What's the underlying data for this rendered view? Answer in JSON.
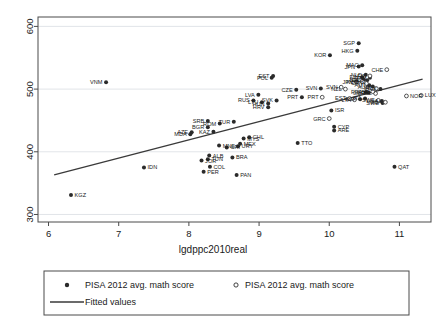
{
  "chart_data": {
    "type": "scatter",
    "title": "",
    "xlabel": "lgdppc2010real",
    "ylabel": "",
    "xlim": [
      5.85,
      11.45
    ],
    "ylim": [
      288,
      615
    ],
    "xticks": [
      "6",
      "7",
      "8",
      "9",
      "10",
      "11"
    ],
    "xtick_values": [
      6,
      7,
      8,
      9,
      10,
      11
    ],
    "yticks": [
      "300",
      "400",
      "500",
      "600"
    ],
    "ytick_values": [
      300,
      400,
      500,
      600
    ],
    "grid": "horizontal",
    "legend_position": "below-plot",
    "legend": {
      "entries": [
        {
          "marker": "filled-circle",
          "label": "PISA 2012 avg. math score"
        },
        {
          "marker": "open-circle",
          "label": "PISA 2012 avg. math score"
        },
        {
          "marker": "line",
          "label": "Fitted values"
        }
      ]
    },
    "fit_line": {
      "label": "Fitted values",
      "x_start": 6.08,
      "y_start": 363,
      "x_end": 11.33,
      "y_end": 516,
      "color": "#3a3a3a"
    },
    "colors": {
      "marker_filled": "#2b2b2b",
      "marker_open": "#2b2b2b",
      "fit_line": "#3a3a3a",
      "grid": "#d9dde2",
      "axis": "#4a4a4a",
      "background": "#ffffff"
    },
    "series": [
      {
        "name": "PISA 2012 avg. math score",
        "marker": "filled-circle",
        "points": [
          {
            "code": "KGZ",
            "x": 6.32,
            "y": 331,
            "lpos": "right"
          },
          {
            "code": "VNM",
            "x": 6.82,
            "y": 511,
            "lpos": "left"
          },
          {
            "code": "IDN",
            "x": 7.36,
            "y": 375,
            "lpos": "right"
          },
          {
            "code": "JOR",
            "x": 8.18,
            "y": 386,
            "lpos": "right"
          },
          {
            "code": "ALB",
            "x": 8.29,
            "y": 394,
            "lpos": "right"
          },
          {
            "code": "TUN",
            "x": 8.27,
            "y": 388,
            "lpos": "right"
          },
          {
            "code": "COL",
            "x": 8.3,
            "y": 376,
            "lpos": "right"
          },
          {
            "code": "PER",
            "x": 8.21,
            "y": 368,
            "lpos": "right"
          },
          {
            "code": "BRA",
            "x": 8.62,
            "y": 391,
            "lpos": "right"
          },
          {
            "code": "PAN",
            "x": 8.68,
            "y": 363,
            "lpos": "right"
          },
          {
            "code": "AZE",
            "x": 8.04,
            "y": 431,
            "lpos": "left"
          },
          {
            "code": "MDA",
            "x": 8.02,
            "y": 428,
            "lpos": "left"
          },
          {
            "code": "SRB",
            "x": 8.27,
            "y": 449,
            "lpos": "left"
          },
          {
            "code": "BGR",
            "x": 8.27,
            "y": 439,
            "lpos": "left"
          },
          {
            "code": "KAZ",
            "x": 8.35,
            "y": 432,
            "lpos": "left"
          },
          {
            "code": "ROM",
            "x": 8.44,
            "y": 445,
            "lpos": "left"
          },
          {
            "code": "TUR",
            "x": 8.64,
            "y": 448,
            "lpos": "left"
          },
          {
            "code": "MNE",
            "x": 8.43,
            "y": 410,
            "lpos": "right"
          },
          {
            "code": "CRI",
            "x": 8.54,
            "y": 407,
            "lpos": "right"
          },
          {
            "code": "URY",
            "x": 8.7,
            "y": 409,
            "lpos": "right"
          },
          {
            "code": "MEX",
            "x": 8.73,
            "y": 413,
            "lpos": "right"
          },
          {
            "code": "MYS",
            "x": 8.78,
            "y": 421,
            "lpos": "right"
          },
          {
            "code": "CHL",
            "x": 8.86,
            "y": 423,
            "lpos": "right"
          },
          {
            "code": "TTO",
            "x": 9.55,
            "y": 414,
            "lpos": "right"
          },
          {
            "code": "QAT",
            "x": 10.93,
            "y": 376,
            "lpos": "right"
          },
          {
            "code": "HRV",
            "x": 9.13,
            "y": 471,
            "lpos": "left"
          },
          {
            "code": "HUN",
            "x": 9.13,
            "y": 477,
            "lpos": "left"
          },
          {
            "code": "LTU",
            "x": 9.04,
            "y": 479,
            "lpos": "left"
          },
          {
            "code": "SVK",
            "x": 9.25,
            "y": 482,
            "lpos": "left"
          },
          {
            "code": "RUS",
            "x": 8.92,
            "y": 482,
            "lpos": "left"
          },
          {
            "code": "LVA",
            "x": 8.99,
            "y": 491,
            "lpos": "left"
          },
          {
            "code": "PRT",
            "x": 9.61,
            "y": 487,
            "lpos": "left"
          },
          {
            "code": "POL",
            "x": 9.18,
            "y": 518,
            "lpos": "left"
          },
          {
            "code": "EST",
            "x": 9.2,
            "y": 521,
            "lpos": "left"
          },
          {
            "code": "CZE",
            "x": 9.53,
            "y": 499,
            "lpos": "left"
          },
          {
            "code": "SVN",
            "x": 9.88,
            "y": 501,
            "lpos": "left"
          },
          {
            "code": "ISR",
            "x": 10.03,
            "y": 466,
            "lpos": "right"
          },
          {
            "code": "CYP",
            "x": 10.07,
            "y": 440,
            "lpos": "right"
          },
          {
            "code": "ARE",
            "x": 10.07,
            "y": 434,
            "lpos": "right"
          },
          {
            "code": "KOR",
            "x": 10.01,
            "y": 554,
            "lpos": "left"
          },
          {
            "code": "SGP",
            "x": 10.42,
            "y": 573,
            "lpos": "left"
          },
          {
            "code": "HKG",
            "x": 10.4,
            "y": 561,
            "lpos": "left"
          },
          {
            "code": "JPN",
            "x": 10.42,
            "y": 536,
            "lpos": "left"
          },
          {
            "code": "MAC",
            "x": 10.47,
            "y": 538,
            "lpos": "left"
          },
          {
            "code": "NLD",
            "x": 10.52,
            "y": 523,
            "lpos": "left"
          },
          {
            "code": "DEU",
            "x": 10.54,
            "y": 514,
            "lpos": "left"
          },
          {
            "code": "BEL",
            "x": 10.49,
            "y": 515,
            "lpos": "left"
          },
          {
            "code": "FIN",
            "x": 10.47,
            "y": 519,
            "lpos": "left"
          },
          {
            "code": "AUT",
            "x": 10.57,
            "y": 506,
            "lpos": "left"
          },
          {
            "code": "FRA",
            "x": 10.52,
            "y": 495,
            "lpos": "left"
          },
          {
            "code": "GBR",
            "x": 10.56,
            "y": 494,
            "lpos": "left"
          },
          {
            "code": "ITA",
            "x": 10.51,
            "y": 485,
            "lpos": "left"
          },
          {
            "code": "ESP",
            "x": 10.44,
            "y": 484,
            "lpos": "left"
          },
          {
            "code": "USA",
            "x": 10.75,
            "y": 481,
            "lpos": "left"
          },
          {
            "code": "SWE",
            "x": 10.76,
            "y": 478,
            "lpos": "left"
          },
          {
            "code": "DNK",
            "x": 10.73,
            "y": 500,
            "lpos": "left"
          },
          {
            "code": "AUS",
            "x": 10.62,
            "y": 504,
            "lpos": "left"
          },
          {
            "code": "CAN",
            "x": 10.58,
            "y": 518,
            "lpos": "left"
          }
        ]
      },
      {
        "name": "PISA 2012 avg. math score",
        "marker": "open-circle",
        "points": [
          {
            "code": "CHE",
            "x": 10.82,
            "y": 531,
            "lpos": "left"
          },
          {
            "code": "LUX",
            "x": 11.31,
            "y": 490,
            "lpos": "right"
          },
          {
            "code": "NOR",
            "x": 11.1,
            "y": 489,
            "lpos": "right"
          },
          {
            "code": "IRL",
            "x": 10.67,
            "y": 501,
            "lpos": "left"
          },
          {
            "code": "ISL",
            "x": 10.66,
            "y": 493,
            "lpos": "left"
          },
          {
            "code": "NZL",
            "x": 10.23,
            "y": 500,
            "lpos": "left"
          },
          {
            "code": "GRC",
            "x": 10.0,
            "y": 453,
            "lpos": "left"
          },
          {
            "code": "SVN2",
            "x": 10.17,
            "y": 503,
            "lpos": "left"
          },
          {
            "code": "EST2",
            "x": 10.29,
            "y": 485,
            "lpos": "left"
          },
          {
            "code": "LTA",
            "x": 10.36,
            "y": 483,
            "lpos": "left"
          },
          {
            "code": "KOR2",
            "x": 10.47,
            "y": 512,
            "lpos": "left"
          },
          {
            "code": "JPN2",
            "x": 10.39,
            "y": 511,
            "lpos": "left"
          },
          {
            "code": "CAN2",
            "x": 10.53,
            "y": 509,
            "lpos": "left"
          },
          {
            "code": "GBR2",
            "x": 10.62,
            "y": 496,
            "lpos": "left"
          },
          {
            "code": "SWE2",
            "x": 10.7,
            "y": 482,
            "lpos": "left"
          },
          {
            "code": "USA2",
            "x": 10.8,
            "y": 479,
            "lpos": "left"
          },
          {
            "code": "PRT2",
            "x": 9.9,
            "y": 487,
            "lpos": "left"
          },
          {
            "code": "FIN2",
            "x": 10.58,
            "y": 521,
            "lpos": "left"
          }
        ]
      }
    ]
  },
  "plot": {
    "frame": true,
    "outer_border": true
  }
}
